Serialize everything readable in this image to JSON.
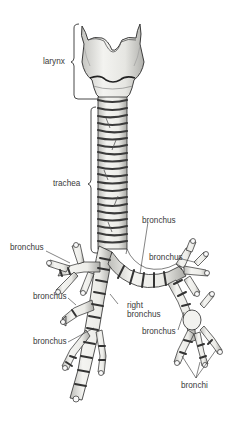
{
  "diagram": {
    "labels": {
      "larynx": "larynx",
      "trachea": "trachea",
      "bronchus_upper_left": "bronchus",
      "bronchus_mid_left": "bronchus",
      "bronchus_lower_left": "bronchus",
      "right_bronchus_line1": "right",
      "right_bronchus_line2": "bronchus",
      "bronchus_top_right": "bronchus",
      "bronchus_right_branch": "bronchus",
      "bronchus_lower_right": "bronchus",
      "bronchi": "bronchi"
    },
    "colors": {
      "background": "#ffffff",
      "ink": "#2a2a2a",
      "cartilage_fill": "#e9e9e6",
      "ring_dark": "#4a4a4a",
      "label_text": "#3a3a3a"
    }
  }
}
